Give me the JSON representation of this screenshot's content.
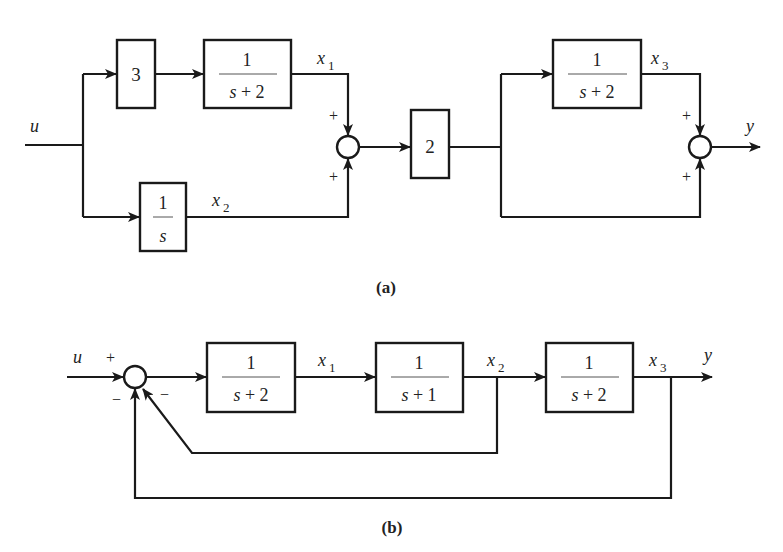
{
  "figure_a": {
    "caption": "(a)",
    "input_label": "u",
    "output_label": "y",
    "blocks": [
      {
        "id": "gain3",
        "label": "3"
      },
      {
        "id": "tf1",
        "num": "1",
        "den": "s + 2"
      },
      {
        "id": "integrator",
        "num": "1",
        "den": "s"
      },
      {
        "id": "gain2",
        "label": "2"
      },
      {
        "id": "tf3",
        "num": "1",
        "den": "s + 2"
      }
    ],
    "signals": {
      "x1": {
        "base": "x",
        "sub": "1"
      },
      "x2": {
        "base": "x",
        "sub": "2"
      },
      "x3": {
        "base": "x",
        "sub": "3"
      }
    },
    "summers": [
      {
        "id": "sum1",
        "signs": [
          "+",
          "+"
        ]
      },
      {
        "id": "sum2",
        "signs": [
          "+",
          "+"
        ]
      }
    ]
  },
  "figure_b": {
    "caption": "(b)",
    "input_label": "u",
    "output_label": "y",
    "blocks": [
      {
        "id": "tf1",
        "num": "1",
        "den": "s + 2"
      },
      {
        "id": "tf2",
        "num": "1",
        "den": "s + 1"
      },
      {
        "id": "tf3",
        "num": "1",
        "den": "s + 2"
      }
    ],
    "signals": {
      "x1": {
        "base": "x",
        "sub": "1"
      },
      "x2": {
        "base": "x",
        "sub": "2"
      },
      "x3": {
        "base": "x",
        "sub": "3"
      }
    },
    "summer": {
      "signs": [
        "+",
        "−",
        "−"
      ]
    }
  }
}
